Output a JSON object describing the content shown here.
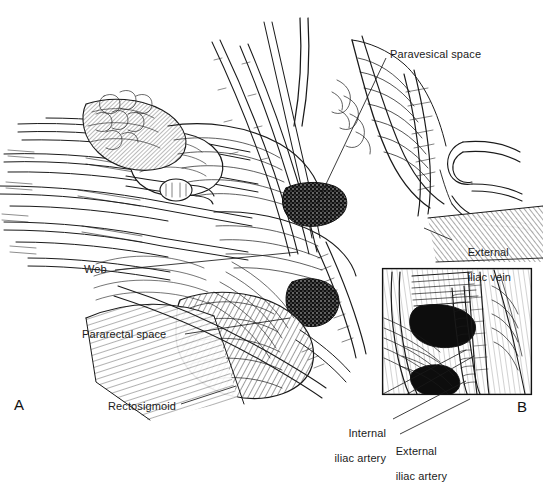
{
  "figure": {
    "kind": "surgical-anatomy-line-illustration",
    "background_color": "#ffffff",
    "ink_color": "#1a1a1a",
    "width": 543,
    "height": 465
  },
  "panels": [
    {
      "id": "A",
      "label": "A",
      "x": 14,
      "y": 396
    },
    {
      "id": "B",
      "label": "B",
      "x": 517,
      "y": 398
    }
  ],
  "inset": {
    "name": "panel-b-inset",
    "x": 382,
    "y": 268,
    "width": 150,
    "height": 127,
    "border_color": "#111111",
    "border_width": 1
  },
  "labels": [
    {
      "id": "paravesical-space",
      "text": "Paravesical space",
      "lines": [
        "Paravesical space"
      ],
      "x": 390,
      "y": 48,
      "align": "left",
      "leader": {
        "from": [
          386,
          58
        ],
        "to": [
          317,
          203
        ]
      }
    },
    {
      "id": "external-iliac-vein",
      "text": "External iliac vein",
      "lines": [
        "External",
        "iliac vein"
      ],
      "x": 455,
      "y": 233,
      "align": "left",
      "leader": {
        "from": [
          452,
          240
        ],
        "to": [
          424,
          228
        ]
      }
    },
    {
      "id": "web",
      "text": "Web",
      "lines": [
        "Web"
      ],
      "x": 84,
      "y": 263,
      "align": "left",
      "leader": {
        "from": [
          115,
          270
        ],
        "to": [
          298,
          252
        ]
      }
    },
    {
      "id": "pararectal-space",
      "text": "Pararectal space",
      "lines": [
        "Pararectal space"
      ],
      "x": 82,
      "y": 328,
      "align": "left",
      "leader": {
        "from": [
          185,
          334
        ],
        "to": [
          290,
          318
        ]
      }
    },
    {
      "id": "rectosigmoid",
      "text": "Rectosigmoid",
      "lines": [
        "Rectosigmoid"
      ],
      "x": 108,
      "y": 400,
      "align": "left",
      "leader": {
        "from": [
          181,
          404
        ],
        "to": [
          236,
          386
        ]
      }
    },
    {
      "id": "internal-iliac-artery",
      "text": "Internal iliac artery",
      "lines": [
        "Internal",
        "iliac artery"
      ],
      "x": 326,
      "y": 414,
      "align": "right",
      "leader": {
        "from": [
          393,
          419
        ],
        "to": [
          466,
          381
        ]
      }
    },
    {
      "id": "external-iliac-artery",
      "text": "External iliac artery",
      "lines": [
        "External",
        "iliac artery"
      ],
      "x": 383,
      "y": 432,
      "align": "left",
      "leader": {
        "from": [
          400,
          434
        ],
        "to": [
          470,
          399
        ]
      }
    }
  ]
}
